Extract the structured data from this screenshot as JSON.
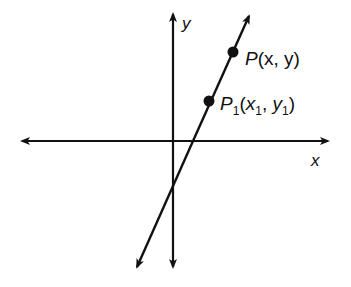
{
  "diagram": {
    "type": "coordinate-plane-line",
    "axes": {
      "x_label": "x",
      "y_label": "y"
    },
    "points": [
      {
        "id": "P",
        "label": "P(x, y)",
        "name": "P",
        "coords": "(x, y)"
      },
      {
        "id": "P1",
        "label": "P1(x1, y1)",
        "name": "P",
        "subscript": "1",
        "x": "x",
        "x_sub": "1",
        "y": "y",
        "y_sub": "1"
      }
    ],
    "colors": {
      "stroke": "#111111",
      "background": "#ffffff"
    }
  }
}
